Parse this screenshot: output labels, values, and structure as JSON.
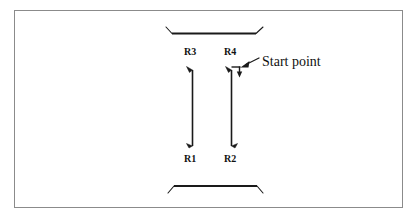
{
  "figure": {
    "kind": "technical-line-diagram",
    "background_color": "#ffffff",
    "stroke_color": "#1a1a1a",
    "border_color": "#8b8b8b"
  },
  "labels": {
    "r1": "R1",
    "r2": "R2",
    "r3": "R3",
    "r4": "R4",
    "start_point": "Start point"
  },
  "geometry": {
    "border": {
      "x": 14,
      "y": 10,
      "width": 389,
      "height": 198
    },
    "top_rail": {
      "x1": 172,
      "y1": 33,
      "x2": 256,
      "y2": 33
    },
    "bottom_rail": {
      "x1": 174,
      "y1": 186,
      "x2": 257,
      "y2": 186
    },
    "left_column": {
      "x": 192,
      "y_top": 71,
      "y_bottom": 146,
      "top_label": "R3",
      "bottom_label": "R1"
    },
    "right_column": {
      "x": 231,
      "y_top": 71,
      "y_bottom": 146,
      "top_label": "R4",
      "bottom_label": "R2"
    },
    "start_marker": {
      "x": 239,
      "y_top": 67,
      "y_bottom": 77
    },
    "leader": {
      "from_x": 258,
      "from_y": 59,
      "to_x": 240,
      "to_y": 67
    }
  }
}
